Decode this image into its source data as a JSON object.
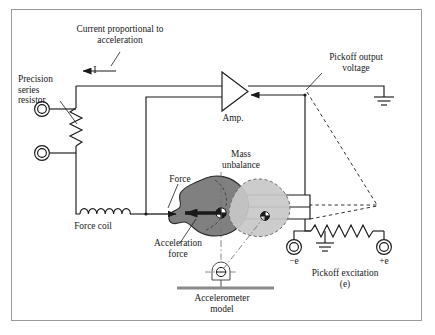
{
  "figure": {
    "type": "schematic-diagram",
    "border_color": "#9a9a9a",
    "line_color": "#1a1a1a",
    "background": "#ffffff"
  },
  "labels": {
    "current_note_line1": "Current proportional to",
    "current_note_line2": "acceleration",
    "current_symbol": "I",
    "precision_resistor_line1": "Precision",
    "precision_resistor_line2": "series",
    "precision_resistor_line3": "resistor",
    "force_coil": "Force coil",
    "force": "Force",
    "acceleration_force_line1": "Acceleration",
    "acceleration_force_line2": "force",
    "amplifier": "Amp.",
    "mass_unbalance_line1": "Mass",
    "mass_unbalance_line2": "unbalance",
    "pickoff_output_line1": "Pickoff output",
    "pickoff_output_line2": "voltage",
    "pickoff_excitation_line1": "Pickoff excitation",
    "pickoff_excitation_line2": "(e)",
    "excitation_negative": "−e",
    "excitation_positive": "+e",
    "accelerometer_model_line1": "Accelerometer",
    "accelerometer_model_line2": "model"
  },
  "components": {
    "precision_series_resistor": {
      "name": "precision series resistor",
      "symbol": "zigzag-resistor",
      "terminals": 2
    },
    "force_coil": {
      "name": "force coil",
      "symbol": "inductor-coil",
      "loops": 6
    },
    "amplifier": {
      "name": "amplifier",
      "symbol": "triangle-pointing-left"
    },
    "proof_mass": {
      "name": "proof mass",
      "fill": "#808080",
      "cg_marker": "pie-quadrant"
    },
    "displaced_mass": {
      "name": "displaced proof mass (mass unbalance)",
      "fill": "#c8c8c8",
      "outline": "dashed",
      "cg_marker": "pie-quadrant"
    },
    "pickoff": {
      "name": "capacitive pickoff wedge",
      "symbol": "trapezoid-wedge"
    },
    "excitation_resistor": {
      "name": "pickoff excitation resistor",
      "symbol": "zigzag-resistor",
      "center_tap": "ground"
    },
    "grounds": [
      {
        "name": "output-ground",
        "symbol": "three-bar-ground"
      },
      {
        "name": "excitation-ground",
        "symbol": "three-bar-ground"
      }
    ],
    "pivot": {
      "name": "accelerometer pivot hinge",
      "symbol": "hinge-on-base"
    }
  }
}
